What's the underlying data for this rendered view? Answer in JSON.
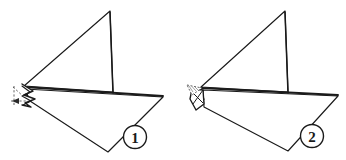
{
  "diagram": {
    "background_color": "#ffffff",
    "stroke_color": "#1a1a1a",
    "fill_color": "#ffffff",
    "accent_color": "#555555",
    "steps": [
      {
        "id": "step-1",
        "number": "1",
        "label_position": {
          "x": 135,
          "y": 142
        },
        "shape_outline": "M 22,85 L 110,11 L 22,85 L 163,97 L 108,152 L 30,100 Z",
        "vertices": {
          "sail_apex": {
            "x": 110,
            "y": 11
          },
          "left_point": {
            "x": 22,
            "y": 85
          },
          "right_point": {
            "x": 163,
            "y": 97
          },
          "bottom_point": {
            "x": 108,
            "y": 152
          },
          "mast_base": {
            "x": 112,
            "y": 92
          }
        },
        "fold_flap": {
          "type": "folded-corner",
          "dashed": true,
          "position": {
            "x": 10,
            "y": 82,
            "w": 28,
            "h": 28
          }
        }
      },
      {
        "id": "step-2",
        "number": "2",
        "label_position": {
          "x": 312,
          "y": 141
        },
        "shape_outline": "M 200,86 L 285,11 L 200,86 L 338,96 L 288,151 L 203,106 Z",
        "vertices": {
          "sail_apex": {
            "x": 285,
            "y": 11
          },
          "left_point": {
            "x": 200,
            "y": 86
          },
          "right_point": {
            "x": 338,
            "y": 96
          },
          "bottom_point": {
            "x": 288,
            "y": 151
          },
          "mast_base": {
            "x": 287,
            "y": 93
          }
        },
        "fold_flap": {
          "type": "folded-corner-hatched",
          "dashed": true,
          "position": {
            "x": 186,
            "y": 84,
            "w": 26,
            "h": 30
          }
        }
      }
    ]
  }
}
